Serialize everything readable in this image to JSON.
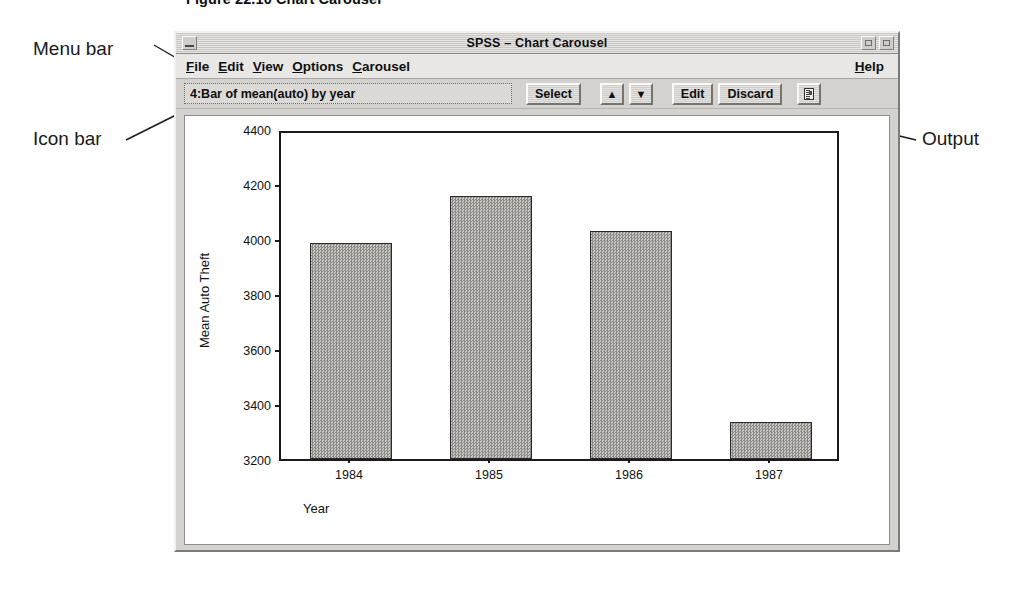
{
  "figure": {
    "caption": "Figure 22.10  Chart Carousel"
  },
  "annotations": {
    "menu_bar": "Menu bar",
    "icon_bar": "Icon bar",
    "output": "Output"
  },
  "window": {
    "title": "SPSS – Chart Carousel",
    "buttons": {
      "minimize": "minimize",
      "restore": "restore",
      "close": "close"
    }
  },
  "menubar": {
    "items": [
      {
        "pre": "",
        "mnemonic": "F",
        "post": "ile"
      },
      {
        "pre": "",
        "mnemonic": "E",
        "post": "dit"
      },
      {
        "pre": "",
        "mnemonic": "V",
        "post": "iew"
      },
      {
        "pre": "",
        "mnemonic": "O",
        "post": "ptions"
      },
      {
        "pre": "",
        "mnemonic": "C",
        "post": "arousel"
      }
    ],
    "help": {
      "pre": "",
      "mnemonic": "H",
      "post": "elp"
    }
  },
  "iconbar": {
    "chart_label": "4:Bar of mean(auto) by year",
    "buttons": [
      {
        "name": "select",
        "label": "Select"
      },
      {
        "name": "previous",
        "label": "▲"
      },
      {
        "name": "next",
        "label": "▼"
      },
      {
        "name": "edit",
        "label": "Edit"
      },
      {
        "name": "discard",
        "label": "Discard"
      }
    ],
    "output_button": {
      "name": "output",
      "icon": "document-icon",
      "label": ""
    }
  },
  "chart_data": {
    "type": "bar",
    "title": "",
    "categories": [
      "1984",
      "1985",
      "1986",
      "1987"
    ],
    "values": [
      3985,
      4155,
      4030,
      3335
    ],
    "xlabel": "Year",
    "ylabel": "Mean Auto Theft",
    "ylim": [
      3200,
      4400
    ],
    "yticks": [
      3200,
      3400,
      3600,
      3800,
      4000,
      4200,
      4400
    ],
    "grid": false,
    "legend": false,
    "bar_color": "#a9a7a4"
  }
}
